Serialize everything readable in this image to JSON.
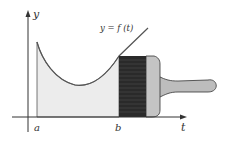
{
  "diagram": {
    "curve_label": "y = f (t)",
    "y_axis_label": "y",
    "x_axis_label": "t",
    "point_a": "a",
    "point_b": "b"
  },
  "colors": {
    "area_fill": "#ececec",
    "curve": "#555555",
    "bristles": "#2a2a2a",
    "ferrule": "#c4c4c4",
    "handle": "#bdbdbd",
    "axis": "#333333"
  }
}
